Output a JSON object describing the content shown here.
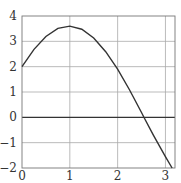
{
  "chart_data": {
    "type": "line",
    "title": "",
    "xlabel": "",
    "ylabel": "",
    "xlim": [
      0,
      3.2
    ],
    "ylim": [
      -2,
      4
    ],
    "grid": true,
    "legend": null,
    "x_ticks": [
      "0",
      "1",
      "2",
      "3"
    ],
    "y_ticks": [
      "4",
      "3",
      "2",
      "1",
      "0",
      "−1",
      "−2"
    ],
    "series": [
      {
        "name": "y = 2cos(x) + 3sin(x)",
        "x": [
          0,
          0.25,
          0.5,
          0.75,
          1.0,
          1.25,
          1.5,
          1.75,
          2.0,
          2.25,
          2.5,
          2.55,
          2.75,
          3.0,
          3.14
        ],
        "y": [
          2.0,
          2.68,
          3.19,
          3.51,
          3.6,
          3.48,
          3.13,
          2.59,
          1.9,
          1.08,
          0.19,
          0.0,
          -0.71,
          -1.55,
          -2.0
        ]
      }
    ]
  }
}
